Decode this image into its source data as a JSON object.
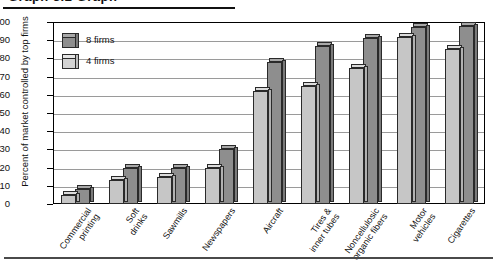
{
  "title_partial": "Graph 3.2  Graph",
  "legend": {
    "entries": [
      {
        "name": "series-8-firms",
        "label": "8 firms",
        "color": "#8e8e8e"
      },
      {
        "name": "series-4-firms",
        "label": "4 firms",
        "color": "#c6c6c6"
      }
    ]
  },
  "yaxis": {
    "label": "Percent of market controlled by top firms",
    "ticks": [
      "100",
      "90",
      "80",
      "70",
      "60",
      "50",
      "40",
      "30",
      "20",
      "10",
      "0"
    ]
  },
  "chart_data": {
    "type": "bar",
    "title": "",
    "xlabel": "",
    "ylabel": "Percent of market controlled by top firms",
    "ylim": [
      0,
      100
    ],
    "ytick_step": 10,
    "grid": true,
    "legend_position": "top-left-inside",
    "categories": [
      "Commercial\nprinting",
      "Soft\ndrinks",
      "Sawmills",
      "Newspapers",
      "Aircraft",
      "Tires &\ninner tubes",
      "Noncellulosic\norganic fibers",
      "Motor\nvehicles",
      "Cigarettes"
    ],
    "series": [
      {
        "name": "4 firms",
        "color": "#c6c6c6",
        "values": [
          5,
          13,
          15,
          20,
          62,
          65,
          75,
          92,
          85
        ]
      },
      {
        "name": "8 firms",
        "color": "#8e8e8e",
        "values": [
          8,
          20,
          20,
          30,
          78,
          87,
          91,
          97,
          98
        ]
      }
    ]
  }
}
